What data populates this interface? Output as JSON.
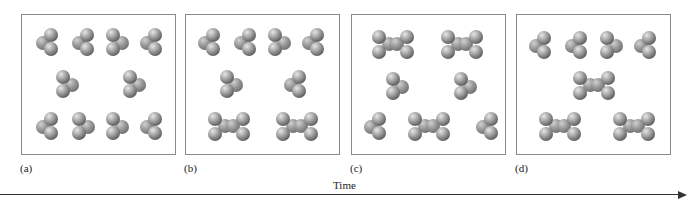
{
  "figure": {
    "panels": [
      {
        "id": "a",
        "label": "(a)",
        "left": 21,
        "molecules": [
          {
            "type": "trimer",
            "x": 14,
            "y": 13,
            "orient": "left"
          },
          {
            "type": "trimer",
            "x": 50,
            "y": 13,
            "orient": "left"
          },
          {
            "type": "trimer",
            "x": 84,
            "y": 13,
            "orient": "right"
          },
          {
            "type": "trimer",
            "x": 118,
            "y": 13,
            "orient": "left"
          },
          {
            "type": "trimer",
            "x": 34,
            "y": 55,
            "orient": "right"
          },
          {
            "type": "trimer",
            "x": 101,
            "y": 55,
            "orient": "right"
          },
          {
            "type": "trimer",
            "x": 14,
            "y": 97,
            "orient": "left"
          },
          {
            "type": "trimer",
            "x": 50,
            "y": 97,
            "orient": "right"
          },
          {
            "type": "trimer",
            "x": 84,
            "y": 97,
            "orient": "right"
          },
          {
            "type": "trimer",
            "x": 118,
            "y": 97,
            "orient": "left"
          }
        ]
      },
      {
        "id": "b",
        "label": "(b)",
        "left": 185,
        "molecules": [
          {
            "type": "trimer",
            "x": 12,
            "y": 13,
            "orient": "left"
          },
          {
            "type": "trimer",
            "x": 48,
            "y": 13,
            "orient": "left"
          },
          {
            "type": "trimer",
            "x": 82,
            "y": 13,
            "orient": "right"
          },
          {
            "type": "trimer",
            "x": 116,
            "y": 13,
            "orient": "left"
          },
          {
            "type": "trimer",
            "x": 34,
            "y": 55,
            "orient": "right"
          },
          {
            "type": "trimer",
            "x": 98,
            "y": 55,
            "orient": "left"
          },
          {
            "type": "dimer",
            "x": 22,
            "y": 97
          },
          {
            "type": "dimer",
            "x": 90,
            "y": 97
          }
        ]
      },
      {
        "id": "c",
        "label": "(c)",
        "left": 351,
        "molecules": [
          {
            "type": "dimer",
            "x": 20,
            "y": 15
          },
          {
            "type": "dimer",
            "x": 89,
            "y": 15
          },
          {
            "type": "trimer",
            "x": 34,
            "y": 57,
            "orient": "right"
          },
          {
            "type": "trimer",
            "x": 102,
            "y": 57,
            "orient": "right"
          },
          {
            "type": "trimer",
            "x": 12,
            "y": 97,
            "orient": "left"
          },
          {
            "type": "dimer",
            "x": 56,
            "y": 97
          },
          {
            "type": "trimer",
            "x": 124,
            "y": 97,
            "orient": "left"
          }
        ]
      },
      {
        "id": "d",
        "label": "(d)",
        "left": 516,
        "molecules": [
          {
            "type": "trimer",
            "x": 12,
            "y": 16,
            "orient": "left"
          },
          {
            "type": "trimer",
            "x": 48,
            "y": 16,
            "orient": "left"
          },
          {
            "type": "trimer",
            "x": 83,
            "y": 16,
            "orient": "right"
          },
          {
            "type": "trimer",
            "x": 117,
            "y": 16,
            "orient": "left"
          },
          {
            "type": "dimer",
            "x": 56,
            "y": 56
          },
          {
            "type": "dimer",
            "x": 22,
            "y": 97
          },
          {
            "type": "dimer",
            "x": 96,
            "y": 97
          }
        ]
      }
    ],
    "axis": {
      "label": "Time",
      "direction": "left-to-right"
    },
    "colors": {
      "atom_dark": "#3c3c3c",
      "atom_mid": "#a8a8a8",
      "atom_highlight": "#e6e6e6",
      "border": "#8a8a8a",
      "axis": "#333333"
    }
  }
}
